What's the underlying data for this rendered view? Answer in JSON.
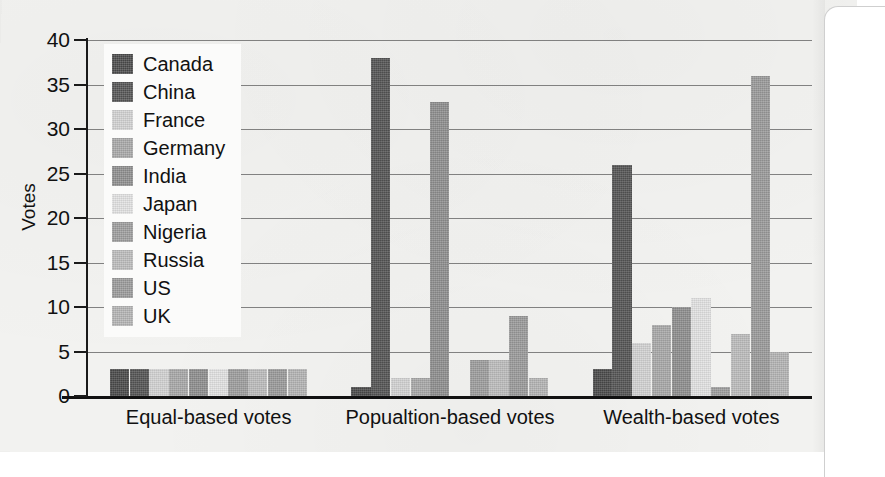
{
  "chart_data": {
    "type": "bar",
    "title": "",
    "subtitle": "",
    "xlabel": "",
    "ylabel": "Votes",
    "ylim": [
      0,
      40
    ],
    "ytick_labels": [
      "40",
      "35",
      "30",
      "25",
      "20",
      "15",
      "10",
      "5",
      "0"
    ],
    "ytick_values": [
      40,
      35,
      30,
      25,
      20,
      15,
      10,
      5,
      0
    ],
    "grid": true,
    "legend_position": "upper-left-inside",
    "categories": [
      "Equal-based votes",
      "Popualtion-based votes",
      "Wealth-based votes"
    ],
    "series": [
      {
        "name": "Canada",
        "color": "#4a4a4a",
        "values": [
          3,
          1,
          3
        ]
      },
      {
        "name": "China",
        "color": "#545454",
        "values": [
          3,
          38,
          26
        ]
      },
      {
        "name": "France",
        "color": "#d2d2d2",
        "values": [
          3,
          2,
          6
        ]
      },
      {
        "name": "Germany",
        "color": "#a8a8a8",
        "values": [
          3,
          2,
          8
        ]
      },
      {
        "name": "India",
        "color": "#8e8e8e",
        "values": [
          3,
          33,
          10
        ]
      },
      {
        "name": "Japan",
        "color": "#e2e2e2",
        "values": [
          3,
          0,
          11
        ]
      },
      {
        "name": "Nigeria",
        "color": "#9d9d9d",
        "values": [
          3,
          4,
          1
        ]
      },
      {
        "name": "Russia",
        "color": "#bcbcbc",
        "values": [
          3,
          4,
          7
        ]
      },
      {
        "name": "US",
        "color": "#9a9a9a",
        "values": [
          3,
          9,
          36
        ]
      },
      {
        "name": "UK",
        "color": "#b4b4b4",
        "values": [
          3,
          2,
          5
        ]
      }
    ]
  },
  "legend": {
    "items": [
      {
        "label": "Canada"
      },
      {
        "label": "China"
      },
      {
        "label": "France"
      },
      {
        "label": "Germany"
      },
      {
        "label": "India"
      },
      {
        "label": "Japan"
      },
      {
        "label": "Nigeria"
      },
      {
        "label": "Russia"
      },
      {
        "label": "US"
      },
      {
        "label": "UK"
      }
    ]
  },
  "axes": {
    "y_title": "Votes",
    "y_ticks": [
      "40",
      "35",
      "30",
      "25",
      "20",
      "15",
      "10",
      "5",
      "0"
    ],
    "x_groups": [
      "Equal-based votes",
      "Popualtion-based votes",
      "Wealth-based votes"
    ]
  },
  "colors": {
    "page_background": "#f2f2f0",
    "axis": "#111111",
    "gridline": "#6d6d6d",
    "legend_background": "#fbfbfa"
  }
}
